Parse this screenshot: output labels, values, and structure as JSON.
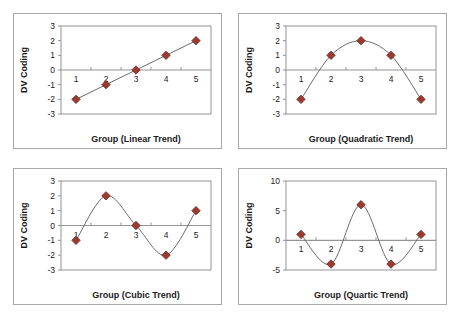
{
  "chart_data": [
    {
      "type": "line",
      "panel": "linear",
      "title": "",
      "xlabel": "Group (Linear Trend)",
      "ylabel": "DV Coding",
      "categories": [
        "1",
        "2",
        "3",
        "4",
        "5"
      ],
      "values": [
        -2,
        -1,
        0,
        1,
        2
      ],
      "yticks": [
        3,
        2,
        1,
        0,
        -1,
        -2,
        -3
      ],
      "ytick_labels": [
        "3",
        "2",
        "1",
        "0",
        "-1",
        "-2",
        "-3"
      ],
      "ylim": [
        -3,
        3
      ],
      "grid": false,
      "legend": "none",
      "marker": "diamond",
      "marker_color": "#9c3a30",
      "line_color": "#6b6b6b",
      "curve": "straight"
    },
    {
      "type": "line",
      "panel": "quadratic",
      "title": "",
      "xlabel": "Group (Quadratic Trend)",
      "ylabel": "DV Coding",
      "categories": [
        "1",
        "2",
        "3",
        "4",
        "5"
      ],
      "values": [
        -2,
        1,
        2,
        1,
        -2
      ],
      "yticks": [
        3,
        2,
        1,
        0,
        -1,
        -2,
        -3
      ],
      "ytick_labels": [
        "3",
        "2",
        "1",
        "0",
        "-1",
        "-2",
        "-3"
      ],
      "ylim": [
        -3,
        3
      ],
      "grid": false,
      "legend": "none",
      "marker": "diamond",
      "marker_color": "#9c3a30",
      "line_color": "#6b6b6b",
      "curve": "smooth"
    },
    {
      "type": "line",
      "panel": "cubic",
      "title": "",
      "xlabel": "Group (Cubic Trend)",
      "ylabel": "DV Coding",
      "categories": [
        "1",
        "2",
        "3",
        "4",
        "5"
      ],
      "values": [
        -1,
        2,
        0,
        -2,
        1
      ],
      "yticks": [
        3,
        2,
        1,
        0,
        -1,
        -2,
        -3
      ],
      "ytick_labels": [
        "3",
        "2",
        "1",
        "0",
        "-1",
        "-2",
        "-3"
      ],
      "ylim": [
        -3,
        3
      ],
      "grid": false,
      "legend": "none",
      "marker": "diamond",
      "marker_color": "#9c3a30",
      "line_color": "#6b6b6b",
      "curve": "smooth"
    },
    {
      "type": "line",
      "panel": "quartic",
      "title": "",
      "xlabel": "Group (Quartic Trend)",
      "ylabel": "DV Coding",
      "categories": [
        "1",
        "2",
        "3",
        "4",
        "5"
      ],
      "values": [
        1,
        -4,
        6,
        -4,
        1
      ],
      "yticks": [
        10,
        5,
        0,
        -5
      ],
      "ytick_labels": [
        "10",
        "5",
        "0",
        "-5"
      ],
      "ylim": [
        -5,
        10
      ],
      "grid": false,
      "legend": "none",
      "marker": "diamond",
      "marker_color": "#9c3a30",
      "line_color": "#6b6b6b",
      "curve": "smooth"
    }
  ]
}
